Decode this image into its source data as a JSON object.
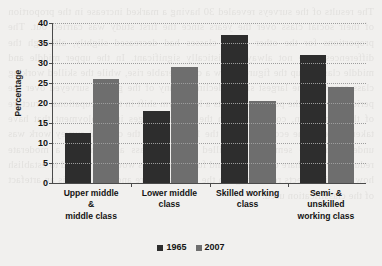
{
  "chart_data": {
    "type": "bar",
    "title": "",
    "xlabel": "",
    "ylabel": "Percentage",
    "ylim": [
      0,
      40
    ],
    "ytick_step": 5,
    "yticks": [
      40,
      35,
      30,
      25,
      20,
      15,
      10,
      5,
      0
    ],
    "grid": true,
    "legend_position": "bottom",
    "categories": [
      "Upper middle\n&\nmiddle class",
      "Lower middle\nclass",
      "Skilled working\nclass",
      "Semi- &\nunskilled\nworking class"
    ],
    "category_lines": [
      [
        "Upper middle",
        "&",
        "middle class"
      ],
      [
        "Lower middle",
        "class"
      ],
      [
        "Skilled working",
        "class"
      ],
      [
        "Semi- &",
        "unskilled",
        "working class"
      ]
    ],
    "series": [
      {
        "name": "1965",
        "color": "#2d2d2d",
        "values": [
          12.5,
          18,
          37,
          32
        ]
      },
      {
        "name": "2007",
        "color": "#6e6e6e",
        "values": [
          26,
          29,
          20.5,
          24
        ]
      }
    ]
  },
  "legend": {
    "items": [
      {
        "label": "1965",
        "color": "#2d2d2d"
      },
      {
        "label": "2007",
        "color": "#6e6e6e"
      }
    ]
  },
  "background": {
    "ghost_text": "The results of the surveys revealed 30 having a marked increase in the proportion of their social class over the years since the first study was carried out. The proportions for the other social classes had decreased slightly, although the differences were not always statistically significant. In the upper middle and middle class group the figures show a considerable rise, while the skilled working class recorded the largest single decline of any of the groups surveyed over the period. Overall, the pattern suggests a long term shift in the occupational structure of the population, consistent with the wider changes in employment that have taken place in the economy since the 1960s, when the original survey work was undertaken. The semi and unskilled working class also showed a moderate reduction in its share of the total, and further analysis would be needed to establish how far this reflects real change in the class structure and how far it is an artefact of the classification used."
  },
  "colors": {
    "page_background": "#f1f0ee",
    "axis": "#4a4a4a",
    "gridline": "#9d9d9d",
    "text": "#141414",
    "series_1965": "#2d2d2d",
    "series_2007": "#6e6e6e"
  }
}
